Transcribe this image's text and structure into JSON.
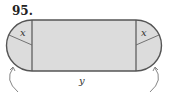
{
  "problem": {
    "number": "95."
  },
  "diagram": {
    "labels": {
      "left_radius": "x",
      "right_radius": "x",
      "length": "y"
    },
    "colors": {
      "fill": "#dcdcdc",
      "stroke": "#555555",
      "text": "#333333"
    }
  }
}
